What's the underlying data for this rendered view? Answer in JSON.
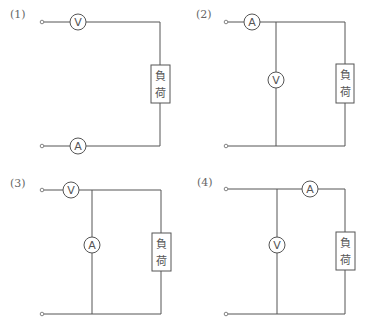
{
  "diagrams": [
    {
      "label": "(1)",
      "load_label": [
        "負",
        "荷"
      ],
      "meters": [
        {
          "type": "voltmeter",
          "symbol": "V",
          "position": "series-top"
        },
        {
          "type": "ammeter",
          "symbol": "A",
          "position": "series-bottom"
        }
      ]
    },
    {
      "label": "(2)",
      "load_label": [
        "負",
        "荷"
      ],
      "meters": [
        {
          "type": "ammeter",
          "symbol": "A",
          "position": "series-top"
        },
        {
          "type": "voltmeter",
          "symbol": "V",
          "position": "parallel"
        }
      ]
    },
    {
      "label": "(3)",
      "load_label": [
        "負",
        "荷"
      ],
      "meters": [
        {
          "type": "voltmeter",
          "symbol": "V",
          "position": "series-top"
        },
        {
          "type": "ammeter",
          "symbol": "A",
          "position": "parallel"
        }
      ]
    },
    {
      "label": "(4)",
      "load_label": [
        "負",
        "荷"
      ],
      "meters": [
        {
          "type": "ammeter",
          "symbol": "A",
          "position": "series-top-after-branch"
        },
        {
          "type": "voltmeter",
          "symbol": "V",
          "position": "parallel"
        }
      ]
    }
  ]
}
